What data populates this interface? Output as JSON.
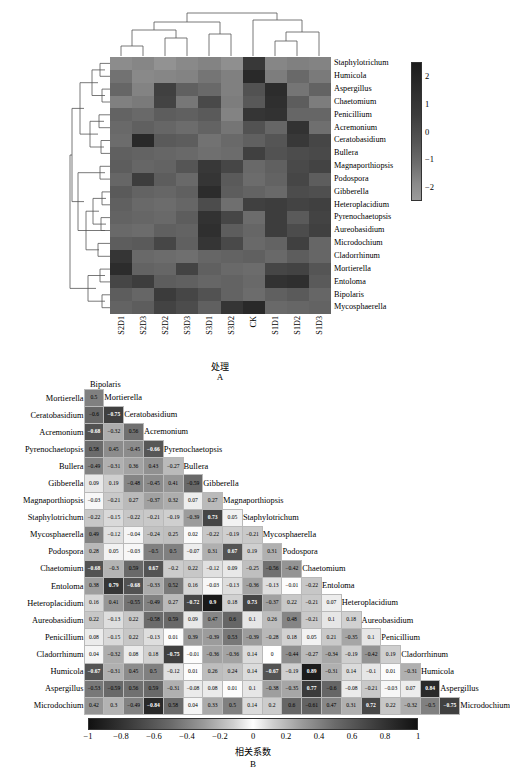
{
  "panel_a": {
    "letter": "A",
    "xaxis_title": "处理",
    "col_labels": [
      "S2D1",
      "S2D3",
      "S2D2",
      "S3D3",
      "S3D1",
      "S3D2",
      "CK",
      "S1D1",
      "S1D2",
      "S1D3"
    ],
    "row_labels": [
      "Staphylotrichum",
      "Humicola",
      "Aspergillus",
      "Chaetomium",
      "Penicillium",
      "Acremonium",
      "Ceratobasidium",
      "Bullera",
      "Magnaporthiopsis",
      "Podospora",
      "Gibberella",
      "Heteroplacidium",
      "Pyrenochaetopsis",
      "Aureobasidium",
      "Microdochium",
      "Cladorrhinum",
      "Mortierella",
      "Entoloma",
      "Bipolaris",
      "Mycosphaerella"
    ],
    "colorbar_ticks": [
      "2",
      "1",
      "0",
      "-1",
      "-2"
    ],
    "colorbar_range": [
      -2.5,
      2.5
    ]
  },
  "panel_b": {
    "letter": "B",
    "axis_title": "相关系数",
    "top_label": "Bipolaris",
    "colorbar_ticks": [
      "-1",
      "-0.8",
      "-0.6",
      "-0.4",
      "-0.2",
      "0",
      "0.2",
      "0.4",
      "0.6",
      "0.8",
      "1"
    ],
    "colorbar_range": [
      -1,
      1
    ],
    "labels": [
      "Bipolaris",
      "Mortierella",
      "Ceratobasidium",
      "Acremonium",
      "Pyrenochaetopsis",
      "Bullera",
      "Gibberella",
      "Magnaporthiopsis",
      "Staphylotrichum",
      "Mycosphaerella",
      "Podospora",
      "Chaetomium",
      "Entoloma",
      "Heteroplacidium",
      "Aureobasidium",
      "Penicillium",
      "Cladorrhinum",
      "Humicola",
      "Aspergillus",
      "Microdochium"
    ],
    "row_labels": [
      "Mortierella",
      "Ceratobasidium",
      "Acremonium",
      "Pyrenochaetopsis",
      "Bullera",
      "Gibberella",
      "Magnaporthiopsis",
      "Staphylotrichum",
      "Mycosphaerella",
      "Podospora",
      "Chaetomium",
      "Entoloma",
      "Heteroplacidium",
      "Aureobasidium",
      "Penicillium",
      "Cladorrhinum",
      "Humicola",
      "Aspergillus",
      "Microdochium"
    ],
    "diag_labels": [
      "Mortierella",
      "Ceratobasidium",
      "Acremonium",
      "Pyrenochaetopsis",
      "Bullera",
      "Gibberella",
      "Magnaporthiopsis",
      "Staphylotrichum",
      "Mycosphaerella",
      "Podospora",
      "Chaetomium",
      "Entoloma",
      "Heteroplacidium",
      "Aureobasidium",
      "Penicillium",
      "Cladorrhinum",
      "Humicola",
      "Aspergillus",
      "Microdochium"
    ]
  },
  "chart_data": {
    "type": "heatmap",
    "panels": [
      {
        "id": "A",
        "type": "heatmap",
        "title": "",
        "xlabel": "处理",
        "ylabel": "",
        "clustered_rows": true,
        "clustered_cols": true,
        "cbar_label": "",
        "zlim": [
          -2.5,
          2.5
        ],
        "x": [
          "S2D1",
          "S2D3",
          "S2D2",
          "S3D3",
          "S3D1",
          "S3D2",
          "CK",
          "S1D1",
          "S1D2",
          "S1D3"
        ],
        "y": [
          "Staphylotrichum",
          "Humicola",
          "Aspergillus",
          "Chaetomium",
          "Penicillium",
          "Acremonium",
          "Ceratobasidium",
          "Bullera",
          "Magnaporthiopsis",
          "Podospora",
          "Gibberella",
          "Heteroplacidium",
          "Pyrenochaetopsis",
          "Aureobasidium",
          "Microdochium",
          "Cladorrhinum",
          "Mortierella",
          "Entoloma",
          "Bipolaris",
          "Mycosphaerella"
        ],
        "z": [
          [
            -1.8,
            -1.6,
            -2.0,
            -1.7,
            -1.5,
            -1.9,
            1.1,
            -1.6,
            -1.4,
            -1.5
          ],
          [
            -0.9,
            -1.7,
            -1.6,
            -1.5,
            -1.0,
            -1.4,
            1.6,
            -1.3,
            -0.6,
            -1.2
          ],
          [
            -0.5,
            -1.5,
            0.8,
            -0.3,
            -0.6,
            -1.4,
            0.2,
            1.5,
            -1.0,
            -0.4
          ],
          [
            -1.4,
            -1.2,
            0.7,
            -1.1,
            0.5,
            -1.3,
            0.0,
            1.4,
            -0.2,
            -1.3
          ],
          [
            -0.4,
            -0.6,
            -0.2,
            -0.3,
            -0.1,
            -1.5,
            1.2,
            1.3,
            -0.5,
            -0.5
          ],
          [
            -0.6,
            -0.3,
            -0.5,
            -0.7,
            -0.4,
            -1.0,
            0.2,
            -0.5,
            1.3,
            -0.8
          ],
          [
            -0.7,
            1.6,
            -0.1,
            -0.2,
            -0.9,
            -0.6,
            -0.3,
            0.1,
            1.1,
            0.6
          ],
          [
            -0.3,
            -0.4,
            -0.5,
            -0.6,
            -0.8,
            -0.7,
            0.8,
            0.2,
            0.4,
            0.5
          ],
          [
            -0.2,
            -0.5,
            -0.4,
            0.1,
            1.1,
            0.6,
            -0.6,
            -0.3,
            0.5,
            0.7
          ],
          [
            -0.5,
            0.9,
            -0.2,
            -0.6,
            1.2,
            -0.1,
            -0.7,
            -0.4,
            0.6,
            -0.2
          ],
          [
            -0.1,
            -0.4,
            -0.5,
            -0.3,
            1.5,
            -0.2,
            -0.4,
            -0.6,
            0.4,
            0.3
          ],
          [
            -0.3,
            -0.6,
            -0.7,
            -0.5,
            0.4,
            -0.8,
            0.8,
            0.9,
            0.7,
            0.8
          ],
          [
            -0.4,
            -0.5,
            -0.6,
            -0.2,
            1.3,
            0.6,
            -0.7,
            0.9,
            -0.1,
            0.7
          ],
          [
            -0.6,
            -0.7,
            -0.3,
            -0.4,
            1.4,
            -0.2,
            -0.5,
            0.9,
            0.4,
            0.8
          ],
          [
            -0.2,
            -0.1,
            0.6,
            -0.3,
            1.2,
            0.5,
            -0.6,
            -0.4,
            0.8,
            -0.5
          ],
          [
            1.2,
            -0.6,
            -0.7,
            -0.8,
            -0.5,
            -0.4,
            -0.3,
            -0.6,
            -0.2,
            -0.5
          ],
          [
            1.5,
            -0.4,
            -0.5,
            0.7,
            -0.3,
            -0.6,
            -0.7,
            0.6,
            0.7,
            0.1
          ],
          [
            0.6,
            0.9,
            -0.2,
            -0.3,
            -0.5,
            -0.4,
            -0.6,
            1.3,
            1.4,
            -0.1
          ],
          [
            -0.2,
            -0.5,
            1.0,
            0.6,
            0.2,
            -0.4,
            -0.7,
            -0.3,
            -0.1,
            -0.5
          ],
          [
            -0.4,
            -0.2,
            0.7,
            0.4,
            -0.3,
            1.2,
            1.6,
            -0.6,
            -0.5,
            -0.4
          ]
        ]
      },
      {
        "id": "B",
        "type": "heatmap",
        "subtype": "correlation-matrix-lower-triangle",
        "xlabel": "相关系数",
        "zlim": [
          -1,
          1
        ],
        "variables": [
          "Bipolaris",
          "Mortierella",
          "Ceratobasidium",
          "Acremonium",
          "Pyrenochaetopsis",
          "Bullera",
          "Gibberella",
          "Magnaporthiopsis",
          "Staphylotrichum",
          "Mycosphaerella",
          "Podospora",
          "Chaetomium",
          "Entoloma",
          "Heteroplacidium",
          "Aureobasidium",
          "Penicillium",
          "Cladorrhinum",
          "Humicola",
          "Aspergillus",
          "Microdochium"
        ],
        "rows": [
          {
            "label": "Mortierella",
            "values": [
              0.5
            ]
          },
          {
            "label": "Ceratobasidium",
            "values": [
              -0.6,
              -0.75
            ]
          },
          {
            "label": "Acremonium",
            "values": [
              -0.68,
              -0.32,
              0.56
            ]
          },
          {
            "label": "Pyrenochaetopsis",
            "values": [
              0.58,
              0.45,
              -0.45,
              -0.66
            ]
          },
          {
            "label": "Bullera",
            "values": [
              -0.49,
              -0.31,
              0.36,
              0.43,
              -0.27
            ]
          },
          {
            "label": "Gibberella",
            "values": [
              0.09,
              0.19,
              -0.48,
              -0.45,
              0.41,
              -0.59
            ]
          },
          {
            "label": "Magnaporthiopsis",
            "values": [
              -0.03,
              -0.21,
              0.27,
              -0.37,
              0.32,
              0.07,
              0.27
            ]
          },
          {
            "label": "Staphylotrichum",
            "values": [
              -0.22,
              -0.15,
              -0.22,
              -0.21,
              -0.19,
              -0.39,
              0.73,
              0.05
            ]
          },
          {
            "label": "Mycosphaerella",
            "values": [
              0.49,
              -0.12,
              -0.04,
              -0.24,
              0.25,
              0.02,
              -0.22,
              -0.19,
              -0.21
            ]
          },
          {
            "label": "Podospora",
            "values": [
              0.28,
              0.05,
              -0.03,
              -0.5,
              0.5,
              -0.07,
              0.31,
              0.67,
              0.19,
              0.31
            ]
          },
          {
            "label": "Chaetomium",
            "values": [
              -0.68,
              -0.3,
              0.59,
              0.67,
              -0.2,
              0.22,
              -0.12,
              0.09,
              -0.25,
              -0.56,
              -0.42
            ]
          },
          {
            "label": "Entoloma",
            "values": [
              0.38,
              0.79,
              -0.68,
              -0.33,
              0.52,
              0.16,
              -0.03,
              -0.13,
              -0.36,
              -0.13,
              -0.01,
              -0.22
            ]
          },
          {
            "label": "Heteroplacidium",
            "values": [
              0.16,
              0.41,
              -0.55,
              -0.49,
              0.27,
              -0.72,
              0.9,
              0.18,
              0.73,
              -0.37,
              0.22,
              -0.21,
              0.07
            ]
          },
          {
            "label": "Aureobasidium",
            "values": [
              0.22,
              -0.13,
              0.22,
              -0.58,
              0.59,
              0.09,
              0.47,
              0.6,
              0.1,
              0.26,
              0.48,
              -0.21,
              0.1,
              0.18
            ]
          },
          {
            "label": "Penicillium",
            "values": [
              0.08,
              -0.15,
              0.22,
              -0.13,
              0.01,
              0.39,
              -0.39,
              0.53,
              -0.39,
              -0.28,
              0.18,
              0.05,
              0.21,
              -0.35,
              0.1
            ]
          },
          {
            "label": "Cladorrhinum",
            "values": [
              0.04,
              -0.32,
              0.08,
              0.18,
              -0.75,
              -0.01,
              -0.36,
              -0.36,
              0.14,
              0,
              -0.44,
              -0.27,
              -0.34,
              -0.19,
              -0.42,
              0.19
            ]
          },
          {
            "label": "Humicola",
            "values": [
              -0.67,
              -0.31,
              0.45,
              0.5,
              -0.12,
              0.01,
              0.26,
              0.24,
              0.14,
              -0.67,
              -0.19,
              0.89,
              -0.31,
              0.14,
              -0.1,
              0.01,
              -0.31
            ]
          },
          {
            "label": "Aspergillus",
            "values": [
              -0.53,
              -0.59,
              0.56,
              0.59,
              -0.31,
              -0.08,
              0.08,
              0.01,
              0.1,
              -0.38,
              -0.35,
              0.77,
              -0.6,
              -0.08,
              -0.21,
              -0.03,
              0.07,
              0.84
            ]
          },
          {
            "label": "Microdochium",
            "values": [
              0.42,
              0.3,
              -0.49,
              -0.84,
              0.58,
              0.04,
              0.33,
              0.5,
              0.14,
              0.2,
              0.6,
              -0.61,
              0.47,
              0.31,
              0.72,
              0.22,
              -0.32,
              -0.5,
              -0.75
            ]
          }
        ]
      }
    ]
  }
}
